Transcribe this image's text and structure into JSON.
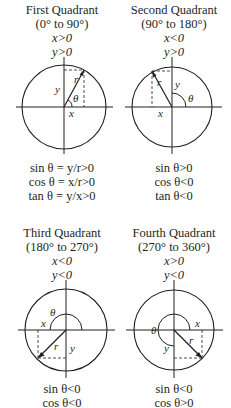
{
  "quadrants": [
    {
      "title": "First Quadrant",
      "range": "(0° to 90°)",
      "x_cond": "x>0",
      "y_cond": "y>0",
      "sin": "sin θ = y/r>0",
      "cos": "cos θ = x/r>0",
      "tan": "tan θ = y/x>0",
      "labels": {
        "r": "r",
        "x": "x",
        "y": "y",
        "theta": "θ"
      }
    },
    {
      "title": "Second Quadrant",
      "range": "(90° to 180°)",
      "x_cond": "x<0",
      "y_cond": "y>0",
      "sin": "sin θ>0",
      "cos": "cos θ<0",
      "tan": "tan θ<0",
      "labels": {
        "r": "r",
        "x": "x",
        "y": "y",
        "theta": "θ"
      }
    },
    {
      "title": "Third Quadrant",
      "range": "(180° to 270°)",
      "x_cond": "x<0",
      "y_cond": "y<0",
      "sin": "sin θ<0",
      "cos": "cos θ<0",
      "labels": {
        "r": "r",
        "x": "x",
        "y": "y",
        "theta": "θ"
      }
    },
    {
      "title": "Fourth Quadrant",
      "range": "(270° to 360°)",
      "x_cond": "x>0",
      "y_cond": "y<0",
      "sin": "sin θ<0",
      "cos": "cos θ>0",
      "labels": {
        "r": "r",
        "x": "x",
        "y": "y",
        "theta": "θ"
      }
    }
  ]
}
